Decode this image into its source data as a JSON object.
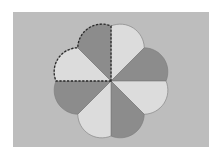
{
  "figure": {
    "type": "eight-petal flower",
    "background_color": "#bdbdbd",
    "page_color": "#ffffff",
    "center": [
      111,
      81
    ],
    "axis_radius": 55,
    "diagonal_radius": 47,
    "arc_radius": 24,
    "colors": {
      "light": "#dcdcdc",
      "dark": "#8c8c8c",
      "edge": "#7a7a7a",
      "highlight": "#2a2a2a"
    },
    "petals": [
      {
        "from_deg": 90,
        "to_deg": 45,
        "shade": "light",
        "highlighted": false
      },
      {
        "from_deg": 45,
        "to_deg": 0,
        "shade": "dark",
        "highlighted": false
      },
      {
        "from_deg": 0,
        "to_deg": -45,
        "shade": "light",
        "highlighted": false
      },
      {
        "from_deg": -45,
        "to_deg": -90,
        "shade": "dark",
        "highlighted": false
      },
      {
        "from_deg": -90,
        "to_deg": -135,
        "shade": "light",
        "highlighted": false
      },
      {
        "from_deg": -135,
        "to_deg": -180,
        "shade": "dark",
        "highlighted": false
      },
      {
        "from_deg": 180,
        "to_deg": 135,
        "shade": "light",
        "highlighted": true
      },
      {
        "from_deg": 135,
        "to_deg": 90,
        "shade": "dark",
        "highlighted": true
      }
    ],
    "highlight_style": "dashed outline around top-left quarter (two petals)"
  }
}
